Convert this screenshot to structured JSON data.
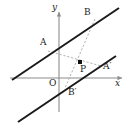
{
  "figure": {
    "kind": "coordinate-geometry-diagram",
    "colors": {
      "background": "#ffffff",
      "line": "#1a1a1a",
      "axis": "#8c8c8c",
      "dashed": "#a8a8a8",
      "label": "#1a1a1a",
      "point_fill": "#111111"
    },
    "axes": {
      "x_label": "x",
      "y_label": "y",
      "origin_label": "O",
      "x_axis": {
        "x1": 10,
        "y1": 78,
        "x2": 122,
        "y2": 78
      },
      "y_axis": {
        "x1": 59,
        "y1": 12,
        "x2": 59,
        "y2": 112
      }
    },
    "lines": [
      {
        "name": "upper-line",
        "x1": 12,
        "y1": 80,
        "x2": 119,
        "y2": 8,
        "style": "solid"
      },
      {
        "name": "lower-line",
        "x1": 18,
        "y1": 122,
        "x2": 116,
        "y2": 56,
        "style": "solid"
      }
    ],
    "points": [
      {
        "name": "A",
        "label": "A",
        "x": 63,
        "y": 45,
        "label_x": 40,
        "label_y": 38,
        "dot": false
      },
      {
        "name": "B",
        "label": "B",
        "x": 97,
        "y": 22,
        "label_x": 84,
        "label_y": 8,
        "dot": false
      },
      {
        "name": "P",
        "label": "P",
        "x": 80,
        "y": 62,
        "label_x": 80,
        "label_y": 65,
        "dot": true
      },
      {
        "name": "A2",
        "label": "A′",
        "x": 98,
        "y": 68,
        "label_x": 103,
        "label_y": 62,
        "dot": false
      },
      {
        "name": "B2",
        "label": "B′",
        "x": 66,
        "y": 86,
        "label_x": 68,
        "label_y": 88,
        "dot": false
      }
    ],
    "dashed_segments": [
      {
        "name": "A-to-A-prime",
        "x1": 48,
        "y1": 51,
        "x2": 101,
        "y2": 66
      },
      {
        "name": "B-to-B-prime",
        "x1": 95,
        "y1": 19,
        "x2": 65,
        "y2": 88
      }
    ]
  }
}
